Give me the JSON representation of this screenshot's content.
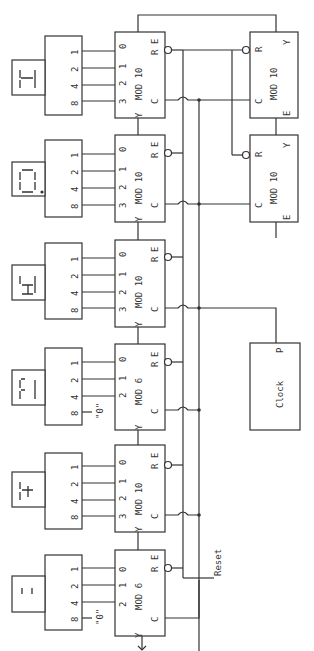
{
  "diagram": {
    "counters": [
      {
        "id": "c1",
        "label": "MOD 10",
        "inputs": [
          "0",
          "1",
          "2",
          "3"
        ],
        "pins": {
          "enable": "E",
          "reset": "R",
          "clock": "C",
          "carry": "Y"
        },
        "decoder_pins": [
          "1",
          "2",
          "4",
          "8"
        ],
        "display": "5"
      },
      {
        "id": "c2",
        "label": "MOD 10",
        "inputs": [
          "0",
          "1",
          "2",
          "3"
        ],
        "pins": {
          "enable": "E",
          "reset": "R",
          "clock": "C",
          "carry": "Y"
        },
        "decoder_pins": [
          "1",
          "2",
          "4",
          "8"
        ],
        "display": "0."
      },
      {
        "id": "c3",
        "label": "MOD 10",
        "inputs": [
          "0",
          "1",
          "2",
          "3"
        ],
        "pins": {
          "enable": "E",
          "reset": "R",
          "clock": "C",
          "carry": "Y"
        },
        "decoder_pins": [
          "1",
          "2",
          "4",
          "8"
        ],
        "display": "6"
      },
      {
        "id": "c4",
        "label": "MOD 6",
        "inputs": [
          "0",
          "1",
          "2"
        ],
        "pins": {
          "enable": "E",
          "reset": "R",
          "clock": "C",
          "carry": "Y"
        },
        "decoder_pins": [
          "1",
          "2",
          "4",
          "8"
        ],
        "display": "3",
        "zero_input": "\"0\""
      },
      {
        "id": "c5",
        "label": "MOD 10",
        "inputs": [
          "0",
          "1",
          "2",
          "3"
        ],
        "pins": {
          "enable": "E",
          "reset": "R",
          "clock": "C",
          "carry": "Y"
        },
        "decoder_pins": [
          "1",
          "2",
          "4",
          "8"
        ],
        "display": "4"
      },
      {
        "id": "c6",
        "label": "MOD 6",
        "inputs": [
          "0",
          "1",
          "2"
        ],
        "pins": {
          "enable": "E",
          "reset": "R",
          "clock": "C",
          "carry": "Y"
        },
        "decoder_pins": [
          "1",
          "2",
          "4",
          "8"
        ],
        "display": "1",
        "zero_input": "\"0\""
      }
    ],
    "prescalers": [
      {
        "id": "p1",
        "label": "MOD 10",
        "pins": {
          "reset": "R",
          "carry": "Y",
          "clock": "C",
          "enable": "E"
        }
      },
      {
        "id": "p2",
        "label": "MOD 10",
        "pins": {
          "reset": "R",
          "carry": "Y",
          "clock": "C",
          "enable": "E"
        }
      }
    ],
    "clock": {
      "label": "Clock",
      "pin": "P"
    },
    "reset_label": "Reset"
  }
}
